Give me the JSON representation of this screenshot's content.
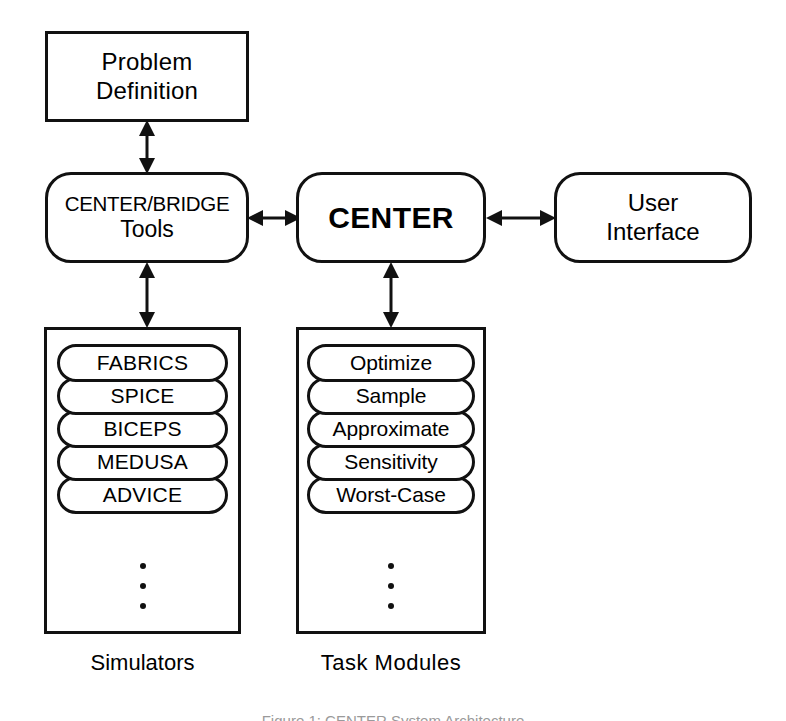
{
  "figure": {
    "caption": "Figure 1: CENTER System Architecture",
    "background_color": "#ffffff",
    "stroke_color": "#111111"
  },
  "nodes": {
    "problem_definition": {
      "label_line1": "Problem",
      "label_line2": "Definition",
      "shape": "rectangle"
    },
    "tools": {
      "label_line1": "CENTER/BRIDGE",
      "label_line2": "Tools",
      "shape": "rounded-rectangle"
    },
    "center": {
      "label": "CENTER",
      "shape": "rounded-rectangle"
    },
    "user_interface": {
      "label_line1": "User",
      "label_line2": "Interface",
      "shape": "rounded-rectangle"
    }
  },
  "columns": {
    "simulators": {
      "caption": "Simulators",
      "items": [
        {
          "label": "FABRICS"
        },
        {
          "label": "SPICE"
        },
        {
          "label": "BICEPS"
        },
        {
          "label": "MEDUSA"
        },
        {
          "label": "ADVICE"
        }
      ],
      "continuation": "vertical-ellipsis"
    },
    "task_modules": {
      "caption": "Task Modules",
      "items": [
        {
          "label": "Optimize"
        },
        {
          "label": "Sample"
        },
        {
          "label": "Approximate"
        },
        {
          "label": "Sensitivity"
        },
        {
          "label": "Worst-Case"
        }
      ],
      "continuation": "vertical-ellipsis"
    }
  },
  "connectors": [
    {
      "id": "problem-tools",
      "from": "problem_definition",
      "to": "tools",
      "direction": "bidirectional",
      "orientation": "vertical"
    },
    {
      "id": "tools-center",
      "from": "tools",
      "to": "center",
      "direction": "bidirectional",
      "orientation": "horizontal"
    },
    {
      "id": "center-ui",
      "from": "center",
      "to": "user_interface",
      "direction": "bidirectional",
      "orientation": "horizontal"
    },
    {
      "id": "tools-simulators",
      "from": "tools",
      "to": "simulators",
      "direction": "bidirectional",
      "orientation": "vertical"
    },
    {
      "id": "center-taskmodules",
      "from": "center",
      "to": "task_modules",
      "direction": "bidirectional",
      "orientation": "vertical"
    }
  ]
}
